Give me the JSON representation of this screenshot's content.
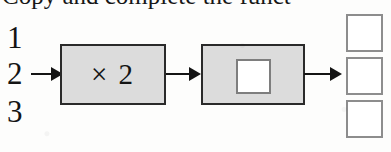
{
  "worksheet": {
    "heading": "Copy and complete the funct",
    "inputs": [
      {
        "label": "1"
      },
      {
        "label": "2"
      },
      {
        "label": "3"
      }
    ],
    "machines": [
      {
        "label": "× 2",
        "has_blank": false
      },
      {
        "label": "",
        "has_blank": true
      }
    ],
    "outputs": [
      {
        "value": ""
      },
      {
        "value": ""
      },
      {
        "value": ""
      }
    ],
    "arrows": [
      {
        "name": "input-to-machine-1"
      },
      {
        "name": "machine-1-to-machine-2"
      },
      {
        "name": "machine-2-to-output"
      }
    ],
    "colors": {
      "ink": "#141414",
      "machine_fill": "#dcdcdc",
      "machine_border": "#2a2a2a",
      "blank_fill": "#ffffff",
      "blank_border": "#7e7e7e",
      "answer_border": "#8d8d8d",
      "page": "#fdfdfc"
    }
  }
}
